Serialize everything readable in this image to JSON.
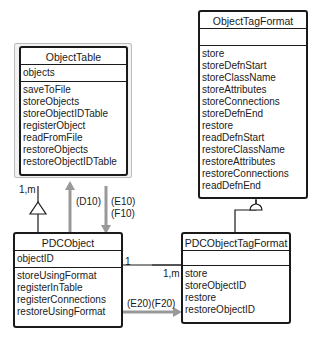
{
  "classes": {
    "object_table": {
      "name": "ObjectTable",
      "attributes": [
        "objects"
      ],
      "operations": [
        "saveToFile",
        "storeObjects",
        "storeObjectIDTable",
        "registerObject",
        "readFromFile",
        "restoreObjects",
        "restoreObjectIDTable"
      ]
    },
    "object_tag_format": {
      "name": "ObjectTagFormat",
      "attributes": [],
      "operations": [
        "store",
        "storeDefnStart",
        "storeClassName",
        "storeAttributes",
        "storeConnections",
        "storeDefnEnd",
        "restore",
        "readDefnStart",
        "restoreClassName",
        "restoreAttributes",
        "restoreConnections",
        "readDefnEnd"
      ]
    },
    "pdc_object": {
      "name": "PDCObject",
      "attributes": [
        "objectID"
      ],
      "operations": [
        "storeUsingFormat",
        "registerInTable",
        "registerConnections",
        "restoreUsingFormat"
      ]
    },
    "pdc_object_tag_format": {
      "name": "PDCObjectTagFormat",
      "attributes": [],
      "operations": [
        "store",
        "storeObjectID",
        "restore",
        "restoreObjectID"
      ]
    }
  },
  "connectors": {
    "aggregation_multiplicity": "1,m",
    "d10": "(D10)",
    "e10": "(E10)",
    "f10": "(F10)",
    "assoc_left_multiplicity": "1",
    "assoc_right_multiplicity": "1,m",
    "e20f20": "(E20)(F20)"
  }
}
